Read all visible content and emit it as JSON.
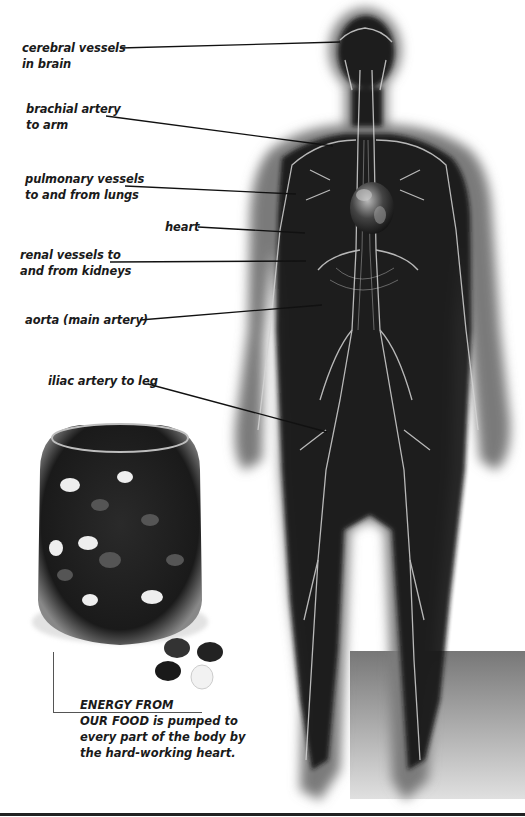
{
  "diagram": {
    "labels": [
      {
        "id": "cerebral",
        "lines": [
          "cerebral vessels",
          "in brain"
        ],
        "x": 22,
        "y": 40,
        "line": {
          "x1": 120,
          "y1": 48,
          "x2": 340,
          "y2": 42
        }
      },
      {
        "id": "brachial",
        "lines": [
          "brachial artery",
          "to arm"
        ],
        "x": 26,
        "y": 101,
        "line": {
          "x1": 106,
          "y1": 116,
          "x2": 333,
          "y2": 146
        }
      },
      {
        "id": "pulmonary",
        "lines": [
          "pulmonary vessels",
          "to and from lungs"
        ],
        "x": 25,
        "y": 171,
        "line": {
          "x1": 125,
          "y1": 186,
          "x2": 296,
          "y2": 194
        }
      },
      {
        "id": "heart",
        "lines": [
          "heart"
        ],
        "x": 165,
        "y": 219,
        "line": {
          "x1": 198,
          "y1": 227,
          "x2": 305,
          "y2": 233
        }
      },
      {
        "id": "renal",
        "lines": [
          "renal vessels to",
          "and from kidneys"
        ],
        "x": 20,
        "y": 247,
        "line": {
          "x1": 110,
          "y1": 262,
          "x2": 306,
          "y2": 261
        }
      },
      {
        "id": "aorta",
        "lines": [
          "aorta (main artery)"
        ],
        "x": 25,
        "y": 312,
        "line": {
          "x1": 140,
          "y1": 320,
          "x2": 322,
          "y2": 305
        }
      },
      {
        "id": "iliac",
        "lines": [
          "iliac artery to leg"
        ],
        "x": 48,
        "y": 373,
        "line": {
          "x1": 148,
          "y1": 384,
          "x2": 327,
          "y2": 432
        }
      }
    ]
  },
  "caption": {
    "lines": [
      "ENERGY FROM",
      "OUR FOOD is pumped to",
      "every part of the body by",
      "the hard-working heart."
    ]
  },
  "colors": {
    "body_dark": "#161616",
    "body_glow": "#8a8a8a",
    "vessel": "#cfcfcf",
    "label_text": "#1a1a1a",
    "floor_panel": "#8c8c8c"
  }
}
